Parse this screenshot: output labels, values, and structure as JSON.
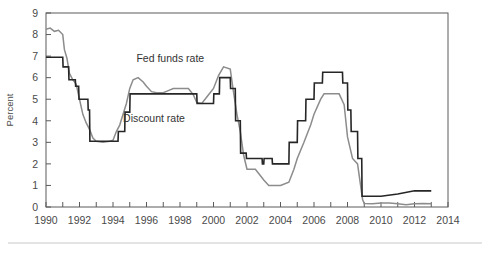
{
  "chart_data": {
    "type": "line",
    "title": "",
    "xlabel": "",
    "ylabel": "Percent",
    "xlim": [
      1990,
      2014
    ],
    "ylim": [
      0,
      9
    ],
    "grid": false,
    "legend_position": "inline-annotations",
    "y_ticks": [
      0,
      1,
      2,
      3,
      4,
      5,
      6,
      7,
      8,
      9
    ],
    "y_tick_labels": [
      "0",
      "1",
      "2",
      "3",
      "4",
      "5",
      "6",
      "7",
      "8",
      "9"
    ],
    "x_ticks": [
      1990,
      1991,
      1992,
      1993,
      1994,
      1995,
      1996,
      1997,
      1998,
      1999,
      2000,
      2001,
      2002,
      2003,
      2004,
      2005,
      2006,
      2007,
      2008,
      2009,
      2010,
      2011,
      2012,
      2013,
      2014
    ],
    "x_tick_labels": [
      "1990",
      "1992",
      "1994",
      "1996",
      "1998",
      "2000",
      "2002",
      "2004",
      "2006",
      "2008",
      "2010",
      "2012",
      "2014"
    ],
    "x_labeled_ticks": [
      1990,
      1992,
      1994,
      1996,
      1998,
      2000,
      2002,
      2004,
      2006,
      2008,
      2010,
      2012,
      2014
    ],
    "annotations": [
      {
        "text": "Fed funds rate",
        "x": 1995.4,
        "y": 6.75
      },
      {
        "text": "Discount rate",
        "x": 1994.6,
        "y": 3.95
      }
    ],
    "series": [
      {
        "name": "Fed funds rate",
        "color": "#8c8c8c",
        "line_width": 1.5,
        "x": [
          1990.0,
          1990.25,
          1990.5,
          1990.75,
          1991.0,
          1991.1,
          1991.25,
          1991.4,
          1991.6,
          1991.8,
          1992.0,
          1992.2,
          1992.4,
          1992.6,
          1992.8,
          1993.0,
          1993.4,
          1993.8,
          1994.0,
          1994.2,
          1994.4,
          1994.6,
          1994.8,
          1995.0,
          1995.2,
          1995.5,
          1995.8,
          1996.0,
          1996.3,
          1996.6,
          1997.0,
          1997.3,
          1997.6,
          1998.0,
          1998.5,
          1998.8,
          1999.0,
          1999.3,
          1999.6,
          2000.0,
          2000.3,
          2000.6,
          2001.0,
          2001.2,
          2001.4,
          2001.6,
          2001.8,
          2002.0,
          2002.5,
          2003.0,
          2003.3,
          2003.6,
          2004.0,
          2004.5,
          2004.8,
          2005.0,
          2005.4,
          2005.8,
          2006.0,
          2006.4,
          2006.6,
          2007.0,
          2007.5,
          2007.8,
          2008.0,
          2008.3,
          2008.6,
          2008.9,
          2009.0,
          2009.5,
          2010.0,
          2010.5,
          2011.0,
          2011.5,
          2012.0,
          2012.5,
          2013.0
        ],
        "y": [
          8.25,
          8.3,
          8.15,
          8.2,
          8.0,
          7.3,
          6.9,
          6.2,
          5.9,
          5.7,
          5.0,
          4.3,
          3.9,
          3.6,
          3.2,
          3.05,
          3.0,
          3.05,
          3.1,
          3.5,
          3.8,
          4.3,
          4.8,
          5.5,
          5.9,
          6.0,
          5.8,
          5.6,
          5.35,
          5.3,
          5.3,
          5.4,
          5.5,
          5.5,
          5.5,
          5.2,
          4.85,
          4.8,
          5.1,
          5.5,
          6.1,
          6.5,
          6.4,
          5.3,
          4.3,
          3.5,
          2.4,
          1.75,
          1.75,
          1.25,
          1.0,
          1.0,
          1.0,
          1.15,
          1.75,
          2.25,
          3.0,
          3.8,
          4.3,
          5.0,
          5.25,
          5.25,
          5.25,
          4.75,
          3.25,
          2.25,
          2.0,
          0.35,
          0.16,
          0.15,
          0.18,
          0.18,
          0.15,
          0.1,
          0.15,
          0.16,
          0.15
        ]
      },
      {
        "name": "Discount rate",
        "color": "#262626",
        "line_width": 1.6,
        "x": [
          1990.0,
          1991.0,
          1991.02,
          1991.35,
          1991.37,
          1991.75,
          1991.77,
          1991.95,
          1991.97,
          1992.5,
          1992.52,
          1992.6,
          1992.62,
          1994.3,
          1994.32,
          1994.7,
          1994.72,
          1995.0,
          1995.02,
          1996.0,
          1996.02,
          1999.0,
          1999.02,
          1999.5,
          1999.52,
          2000.0,
          2000.02,
          2000.35,
          2000.37,
          2001.0,
          2001.02,
          2001.3,
          2001.32,
          2001.6,
          2001.62,
          2001.95,
          2001.97,
          2002.9,
          2002.92,
          2003.0,
          2003.02,
          2003.5,
          2003.52,
          2004.5,
          2004.52,
          2005.0,
          2005.02,
          2005.5,
          2005.52,
          2006.0,
          2006.02,
          2006.5,
          2006.52,
          2007.7,
          2007.72,
          2008.0,
          2008.02,
          2008.2,
          2008.22,
          2008.6,
          2008.62,
          2008.85,
          2008.87,
          2009.0,
          2010.0,
          2011.0,
          2012.0,
          2013.0
        ],
        "y": [
          6.95,
          6.95,
          6.5,
          6.5,
          5.9,
          5.9,
          5.6,
          5.6,
          5.0,
          5.0,
          4.5,
          4.5,
          3.05,
          3.05,
          3.5,
          3.5,
          4.4,
          4.4,
          5.25,
          5.25,
          5.25,
          5.25,
          4.8,
          4.8,
          4.8,
          4.8,
          5.25,
          5.25,
          6.0,
          6.0,
          5.5,
          5.5,
          4.0,
          4.0,
          2.5,
          2.5,
          2.25,
          2.25,
          2.0,
          2.0,
          2.25,
          2.25,
          2.0,
          2.0,
          3.0,
          3.0,
          4.0,
          4.0,
          5.0,
          5.0,
          5.75,
          5.75,
          6.25,
          6.25,
          5.75,
          5.75,
          4.5,
          4.5,
          3.5,
          3.5,
          2.25,
          2.25,
          0.5,
          0.5,
          0.5,
          0.6,
          0.75,
          0.75
        ]
      }
    ]
  }
}
